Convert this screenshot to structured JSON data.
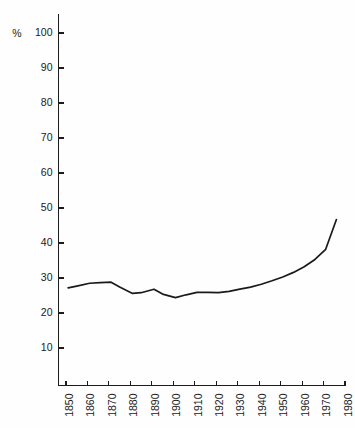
{
  "chart_data": {
    "type": "line",
    "title": "",
    "subtitle": "",
    "xlabel": "",
    "ylabel": "%",
    "unit_label": "%",
    "xlim": [
      1850,
      1980
    ],
    "ylim": [
      0,
      100
    ],
    "grid": false,
    "legend": "none",
    "y_ticks": [
      10,
      20,
      30,
      40,
      50,
      60,
      70,
      80,
      90,
      100
    ],
    "y_tick_labels": [
      "10",
      "20",
      "30",
      "40",
      "50",
      "60",
      "70",
      "80",
      "90",
      "100"
    ],
    "x_ticks": [
      1850,
      1860,
      1870,
      1880,
      1890,
      1900,
      1910,
      1920,
      1930,
      1940,
      1950,
      1960,
      1970,
      1980
    ],
    "x_tick_labels": [
      "1850",
      "1860",
      "1870",
      "1880",
      "1890",
      "1900",
      "1910",
      "1920",
      "1930",
      "1940",
      "1950",
      "1960",
      "1970",
      "1980"
    ],
    "x_tick_rotation": -90,
    "series": [
      {
        "name": "value",
        "color": "#1a1a1a",
        "x": [
          1851,
          1855,
          1861,
          1866,
          1871,
          1875,
          1881,
          1885,
          1891,
          1895,
          1901,
          1906,
          1911,
          1916,
          1921,
          1926,
          1931,
          1936,
          1941,
          1946,
          1951,
          1956,
          1961,
          1966,
          1971,
          1976
        ],
        "y": [
          27.2,
          27.7,
          28.5,
          28.7,
          28.8,
          27.4,
          25.6,
          25.8,
          26.8,
          25.4,
          24.4,
          25.2,
          25.9,
          25.9,
          25.8,
          26.2,
          26.8,
          27.4,
          28.2,
          29.2,
          30.3,
          31.6,
          33.2,
          35.3,
          38.2,
          46.7
        ]
      }
    ]
  },
  "axes": {
    "y_axis_name": "percent-axis",
    "x_axis_name": "year-axis"
  }
}
